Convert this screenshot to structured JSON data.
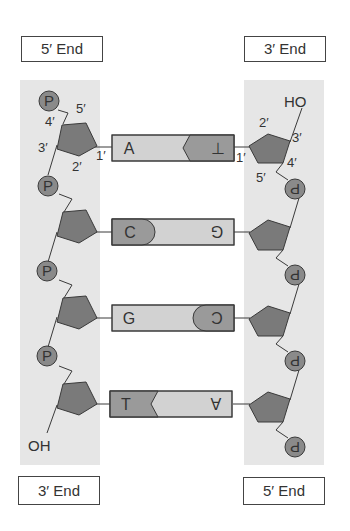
{
  "labels": {
    "top_left_end": "5′ End",
    "top_right_end": "3′ End",
    "bottom_left_end": "3′ End",
    "bottom_right_end": "5′ End",
    "left_terminal": "OH",
    "right_terminal": "HO",
    "phosphate": "P"
  },
  "carbon_labels": {
    "left": [
      "5′",
      "4′",
      "3′",
      "2′",
      "1′"
    ],
    "right": [
      "2′",
      "3′",
      "1′",
      "4′",
      "5′"
    ]
  },
  "base_pairs": [
    {
      "left": "A",
      "right": "T",
      "right_display": "⊥"
    },
    {
      "left": "C",
      "right": "G",
      "right_display": "⅁"
    },
    {
      "left": "G",
      "right": "C",
      "right_display": "Ɔ"
    },
    {
      "left": "T",
      "right": "A",
      "right_display": "∀"
    }
  ],
  "colors": {
    "band": "#e6e6e6",
    "sugar": "#7a7a7a",
    "phosphate": "#8a8a8a",
    "base_dark": "#9a9a9a",
    "base_light": "#d2d2d2",
    "outline": "#3a3a3a"
  }
}
